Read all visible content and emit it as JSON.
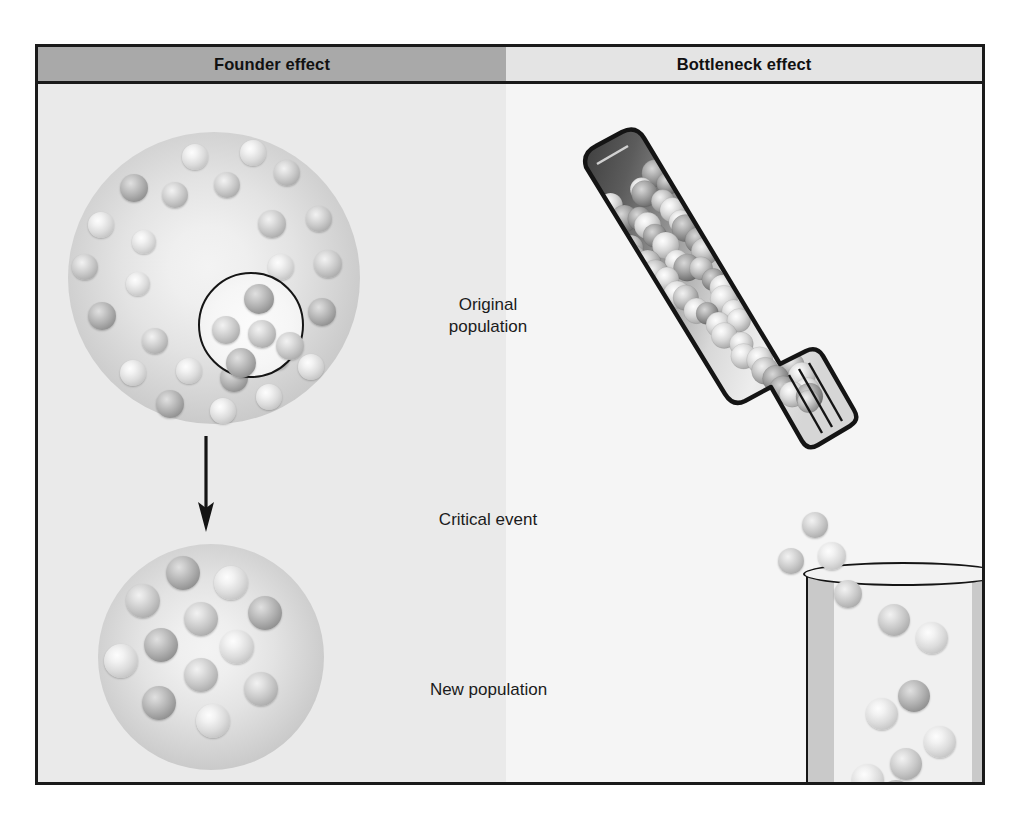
{
  "figure": {
    "colors": {
      "header_left_bg": "#a9a9a9",
      "header_right_bg": "#e4e4e4",
      "panel_left_bg": "#eaeaea",
      "panel_right_bg": "#f5f5f5",
      "frame_border": "#1a1a1a",
      "text": "#1b1b1b"
    }
  },
  "header": {
    "left_label": "Founder effect",
    "right_label": "Bottleneck effect"
  },
  "labels": {
    "original_population": "Original\npopulation",
    "critical_event": "Critical event",
    "new_population": "New population"
  },
  "founder_panel": {
    "original_population_disc": {
      "name": "original-population",
      "sphere_count": 36,
      "spheres": [
        {
          "x": 114,
          "y": 12,
          "r": 13,
          "tone": "lt"
        },
        {
          "x": 172,
          "y": 8,
          "r": 13,
          "tone": "lt"
        },
        {
          "x": 52,
          "y": 42,
          "r": 14,
          "tone": "dk"
        },
        {
          "x": 94,
          "y": 50,
          "r": 13,
          "tone": "md"
        },
        {
          "x": 146,
          "y": 40,
          "r": 13,
          "tone": "md"
        },
        {
          "x": 206,
          "y": 28,
          "r": 13,
          "tone": "md"
        },
        {
          "x": 20,
          "y": 80,
          "r": 13,
          "tone": "lt"
        },
        {
          "x": 64,
          "y": 98,
          "r": 12,
          "tone": "lt"
        },
        {
          "x": 190,
          "y": 78,
          "r": 14,
          "tone": "md"
        },
        {
          "x": 238,
          "y": 74,
          "r": 13,
          "tone": "md"
        },
        {
          "x": 4,
          "y": 122,
          "r": 13,
          "tone": "md"
        },
        {
          "x": 200,
          "y": 122,
          "r": 13,
          "tone": "lt"
        },
        {
          "x": 246,
          "y": 118,
          "r": 14,
          "tone": "md"
        },
        {
          "x": 58,
          "y": 140,
          "r": 12,
          "tone": "lt"
        },
        {
          "x": 20,
          "y": 170,
          "r": 14,
          "tone": "dk"
        },
        {
          "x": 186,
          "y": 168,
          "r": 13,
          "tone": "lt"
        },
        {
          "x": 240,
          "y": 166,
          "r": 14,
          "tone": "dk"
        },
        {
          "x": 74,
          "y": 196,
          "r": 13,
          "tone": "md"
        },
        {
          "x": 136,
          "y": 196,
          "r": 13,
          "tone": "lt"
        },
        {
          "x": 196,
          "y": 212,
          "r": 13,
          "tone": "md"
        },
        {
          "x": 52,
          "y": 228,
          "r": 13,
          "tone": "lt"
        },
        {
          "x": 108,
          "y": 226,
          "r": 13,
          "tone": "lt"
        },
        {
          "x": 152,
          "y": 232,
          "r": 14,
          "tone": "dk"
        },
        {
          "x": 230,
          "y": 222,
          "r": 13,
          "tone": "lt"
        },
        {
          "x": 88,
          "y": 258,
          "r": 14,
          "tone": "dk"
        },
        {
          "x": 142,
          "y": 266,
          "r": 13,
          "tone": "lt"
        },
        {
          "x": 188,
          "y": 252,
          "r": 13,
          "tone": "lt"
        }
      ]
    },
    "founder_sample_ring": {
      "name": "founder-sample-circle",
      "sphere_count": 5,
      "spheres": [
        {
          "x": 44,
          "y": 10,
          "r": 15,
          "tone": "dk"
        },
        {
          "x": 12,
          "y": 42,
          "r": 14,
          "tone": "md"
        },
        {
          "x": 48,
          "y": 46,
          "r": 14,
          "tone": "md"
        },
        {
          "x": 76,
          "y": 58,
          "r": 14,
          "tone": "md"
        },
        {
          "x": 26,
          "y": 74,
          "r": 15,
          "tone": "dk"
        }
      ]
    },
    "new_population_disc": {
      "name": "new-population",
      "sphere_count": 12,
      "spheres": [
        {
          "x": 68,
          "y": 12,
          "r": 17,
          "tone": "dk"
        },
        {
          "x": 116,
          "y": 22,
          "r": 17,
          "tone": "lt"
        },
        {
          "x": 28,
          "y": 40,
          "r": 17,
          "tone": "md"
        },
        {
          "x": 86,
          "y": 58,
          "r": 17,
          "tone": "md"
        },
        {
          "x": 150,
          "y": 52,
          "r": 17,
          "tone": "dk"
        },
        {
          "x": 46,
          "y": 84,
          "r": 17,
          "tone": "dk"
        },
        {
          "x": 122,
          "y": 86,
          "r": 17,
          "tone": "lt"
        },
        {
          "x": 6,
          "y": 100,
          "r": 17,
          "tone": "lt"
        },
        {
          "x": 86,
          "y": 114,
          "r": 17,
          "tone": "md"
        },
        {
          "x": 146,
          "y": 128,
          "r": 17,
          "tone": "md"
        },
        {
          "x": 44,
          "y": 142,
          "r": 17,
          "tone": "dk"
        },
        {
          "x": 98,
          "y": 160,
          "r": 17,
          "tone": "lt"
        }
      ]
    },
    "arrow": {
      "name": "founder-arrow",
      "direction": "down"
    }
  },
  "bottleneck_panel": {
    "bottle": {
      "name": "bottle",
      "rotation_deg": 42,
      "sphere_count": 76
    },
    "drip_spheres": [
      {
        "x": 296,
        "y": 428,
        "r": 13,
        "tone": "md"
      },
      {
        "x": 272,
        "y": 464,
        "r": 13,
        "tone": "md"
      },
      {
        "x": 312,
        "y": 458,
        "r": 14,
        "tone": "lt"
      },
      {
        "x": 328,
        "y": 496,
        "r": 14,
        "tone": "md"
      }
    ],
    "beaker": {
      "name": "beaker",
      "sphere_count": 14,
      "spheres": [
        {
          "x": 70,
          "y": 28,
          "r": 16,
          "tone": "md"
        },
        {
          "x": 108,
          "y": 46,
          "r": 16,
          "tone": "lt"
        },
        {
          "x": 90,
          "y": 104,
          "r": 16,
          "tone": "dk"
        },
        {
          "x": 58,
          "y": 122,
          "r": 16,
          "tone": "lt"
        },
        {
          "x": 116,
          "y": 150,
          "r": 16,
          "tone": "lt"
        },
        {
          "x": 82,
          "y": 172,
          "r": 16,
          "tone": "md"
        },
        {
          "x": 44,
          "y": 188,
          "r": 16,
          "tone": "lt"
        },
        {
          "x": 8,
          "y": 212,
          "r": 16,
          "tone": "dk"
        },
        {
          "x": 40,
          "y": 214,
          "r": 16,
          "tone": "lt"
        },
        {
          "x": 72,
          "y": 204,
          "r": 16,
          "tone": "dk"
        },
        {
          "x": 112,
          "y": 214,
          "r": 16,
          "tone": "md"
        },
        {
          "x": 146,
          "y": 212,
          "r": 16,
          "tone": "lt"
        }
      ]
    }
  }
}
